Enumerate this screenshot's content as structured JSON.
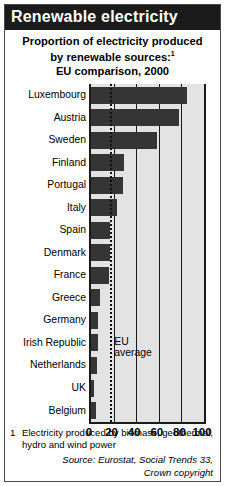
{
  "header": {
    "title": "Renewable electricity",
    "subtitle_line1": "Proportion of electricity produced",
    "subtitle_line2": "by renewable sources:",
    "subtitle_footnote_marker": "1",
    "subtitle_line3": "EU comparison, 2000"
  },
  "footnotes": {
    "number": "1",
    "text": "Electricity produced by biomass, geothermal, hydro and wind power",
    "source_line1": "Source: Eurostat, Social Trends 33,",
    "source_line2": "Crown copyright"
  },
  "annotations": {
    "eu_average_line1": "EU",
    "eu_average_line2": "average",
    "eu_average_value": 17
  },
  "colors": {
    "bar": "#353535",
    "plot_background": "#e3e3e3",
    "title_background": "#1b1b1b",
    "title_text": "#ffffff",
    "axis": "#1b1b1b"
  },
  "chart_data": {
    "type": "bar",
    "orientation": "horizontal",
    "title": "Renewable electricity",
    "subtitle": "Proportion of electricity produced by renewable sources: EU comparison, 2000",
    "xlabel": "",
    "ylabel": "",
    "xlim": [
      0,
      100
    ],
    "xticks": [
      0,
      20,
      40,
      60,
      80,
      100
    ],
    "xtick_labels": [
      "0",
      "20",
      "40",
      "60",
      "80",
      "100"
    ],
    "grid": true,
    "legend": false,
    "categories": [
      "Luxembourg",
      "Austria",
      "Sweden",
      "Finland",
      "Portugal",
      "Italy",
      "Spain",
      "Denmark",
      "France",
      "Greece",
      "Germany",
      "Irish Republic",
      "Netherlands",
      "UK",
      "Belgium"
    ],
    "values": [
      85,
      78,
      58,
      29,
      28,
      23,
      17,
      17,
      16,
      8,
      6,
      6,
      5,
      3,
      4
    ],
    "reference_line": {
      "label": "EU average",
      "value": 17,
      "style": "dotted"
    }
  }
}
